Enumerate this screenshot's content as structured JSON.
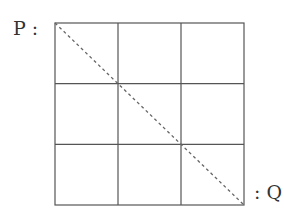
{
  "diagram": {
    "type": "grid-path",
    "rows": 3,
    "cols": 3,
    "labels": {
      "start": "P :",
      "end": ": Q"
    },
    "start_point": "top-left corner",
    "end_point": "bottom-right corner",
    "diagonal": "dashed line from P to Q",
    "colors": {
      "grid": "#555555",
      "diagonal": "#666666",
      "text": "#333333"
    }
  }
}
